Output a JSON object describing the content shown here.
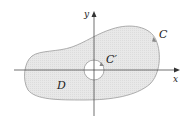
{
  "diagram": {
    "region_label": "D",
    "outer_curve_label": "C",
    "inner_curve_label": "C′",
    "x_axis_label": "x",
    "y_axis_label": "y",
    "colors": {
      "region_fill": "#e6e6e6",
      "boundary_stroke": "#9a9a9a",
      "axis": "#333333",
      "hole_fill": "#ffffff"
    }
  }
}
